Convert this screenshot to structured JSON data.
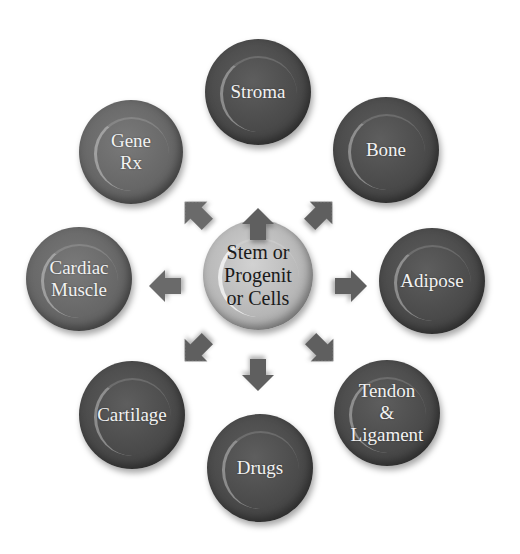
{
  "diagram": {
    "center": {
      "label": "Stem or\nProgenit\nor Cells"
    },
    "nodes": [
      {
        "id": "stroma",
        "label": "Stroma"
      },
      {
        "id": "bone",
        "label": "Bone"
      },
      {
        "id": "adipose",
        "label": "Adipose"
      },
      {
        "id": "tendon-ligament",
        "label": "Tendon\n&\nLigament"
      },
      {
        "id": "drugs",
        "label": "Drugs"
      },
      {
        "id": "cartilage",
        "label": "Cartilage"
      },
      {
        "id": "cardiac-muscle",
        "label": "Cardiac\nMuscle"
      },
      {
        "id": "gene-rx",
        "label": "Gene\nRx"
      }
    ],
    "arrows": [
      "up",
      "up-right",
      "right",
      "down-right",
      "down",
      "down-left",
      "left",
      "up-left"
    ],
    "colors": {
      "background": "#ffffff",
      "outer_node_dark": "#4a4a4a",
      "outer_node_mid": "#676767",
      "center_node": "#b7b7b7",
      "arrow": "#5f5f5f"
    }
  }
}
